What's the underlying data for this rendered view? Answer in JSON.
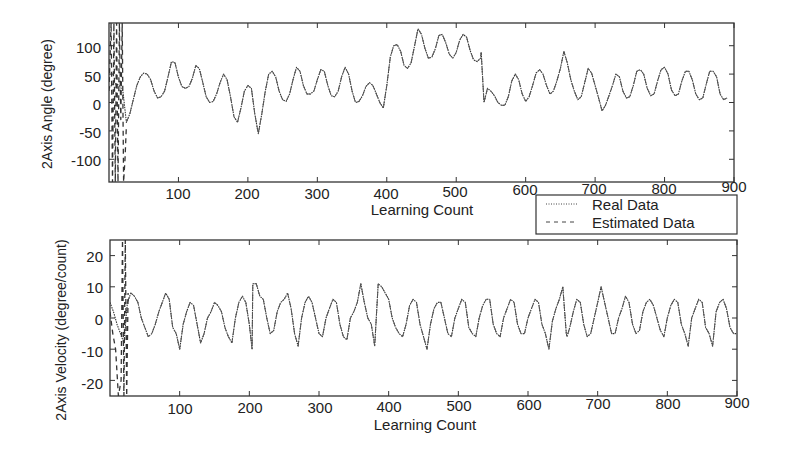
{
  "chart_data": [
    {
      "type": "line",
      "title": "",
      "xlabel": "Learning Count",
      "ylabel": "2Axis Angle (degree)",
      "xlim": [
        0,
        900
      ],
      "ylim": [
        -140,
        140
      ],
      "xticks": [
        100,
        200,
        300,
        400,
        500,
        600,
        700,
        800,
        900
      ],
      "xtick_labels": [
        "100",
        "200",
        "300",
        "400",
        "500",
        "600",
        "700",
        "800",
        "900"
      ],
      "yticks": [
        100,
        50,
        0,
        -50,
        -100
      ],
      "ytick_labels": [
        "100",
        "50",
        "0",
        "-50",
        "-100"
      ],
      "grid": false,
      "series": [
        {
          "name": "Real Data",
          "style": "dotted",
          "x": [
            0,
            5,
            10,
            15,
            20,
            25,
            30,
            35,
            40,
            45,
            50,
            55,
            60,
            65,
            70,
            75,
            80,
            85,
            90,
            95,
            100,
            105,
            110,
            115,
            120,
            125,
            130,
            135,
            140,
            145,
            150,
            155,
            160,
            165,
            170,
            175,
            180,
            185,
            190,
            195,
            200,
            205,
            210,
            215,
            220,
            225,
            230,
            235,
            240,
            245,
            250,
            255,
            260,
            265,
            270,
            275,
            280,
            285,
            290,
            295,
            300,
            305,
            310,
            315,
            320,
            325,
            330,
            335,
            340,
            345,
            350,
            355,
            360,
            365,
            370,
            375,
            380,
            385,
            390,
            395,
            400,
            405,
            410,
            415,
            420,
            425,
            430,
            435,
            440,
            445,
            450,
            455,
            460,
            465,
            470,
            475,
            480,
            485,
            490,
            495,
            500,
            505,
            510,
            515,
            520,
            525,
            530,
            535,
            536,
            540,
            545,
            550,
            555,
            560,
            565,
            570,
            575,
            580,
            585,
            590,
            595,
            600,
            605,
            610,
            615,
            620,
            625,
            630,
            635,
            640,
            645,
            650,
            655,
            660,
            665,
            670,
            675,
            680,
            685,
            690,
            695,
            700,
            705,
            710,
            715,
            720,
            725,
            730,
            735,
            740,
            745,
            750,
            755,
            760,
            765,
            770,
            775,
            780,
            785,
            790,
            795,
            800,
            805,
            810,
            815,
            820,
            825,
            830,
            835,
            840,
            845,
            850,
            855,
            860,
            865,
            870,
            875,
            880,
            885,
            890,
            895,
            900
          ],
          "values": [
            25,
            32,
            33,
            30,
            20,
            -35,
            -20,
            5,
            30,
            45,
            52,
            50,
            40,
            20,
            8,
            10,
            20,
            45,
            72,
            70,
            45,
            28,
            25,
            28,
            42,
            65,
            60,
            35,
            10,
            0,
            2,
            15,
            35,
            50,
            40,
            10,
            -25,
            -35,
            -10,
            20,
            30,
            25,
            -20,
            -55,
            -20,
            20,
            50,
            55,
            45,
            20,
            5,
            2,
            15,
            40,
            62,
            55,
            30,
            15,
            15,
            20,
            40,
            58,
            55,
            30,
            12,
            10,
            20,
            45,
            62,
            50,
            20,
            0,
            2,
            12,
            28,
            35,
            30,
            15,
            0,
            -10,
            30,
            80,
            100,
            102,
            90,
            65,
            60,
            70,
            100,
            130,
            120,
            95,
            78,
            80,
            95,
            118,
            120,
            105,
            85,
            78,
            88,
            110,
            120,
            115,
            92,
            75,
            72,
            78,
            88,
            0,
            25,
            20,
            12,
            0,
            -5,
            -5,
            10,
            38,
            50,
            40,
            15,
            2,
            10,
            30,
            52,
            58,
            50,
            30,
            15,
            20,
            38,
            60,
            90,
            70,
            40,
            20,
            5,
            10,
            35,
            60,
            52,
            30,
            8,
            -15,
            -5,
            12,
            30,
            50,
            45,
            20,
            8,
            10,
            30,
            55,
            58,
            50,
            25,
            12,
            15,
            38,
            58,
            62,
            50,
            22,
            12,
            15,
            38,
            55,
            55,
            40,
            15,
            5,
            8,
            32,
            55,
            55,
            45,
            15,
            5,
            8
          ],
          "color": "#333333"
        },
        {
          "name": "Estimated Data",
          "style": "dashed",
          "note": "tracks Real Data closely; large divergent spikes (beyond +/-140) in the first ~25 counts",
          "x": [
            0,
            3,
            5,
            7,
            9,
            11,
            13,
            15,
            17,
            19,
            21,
            23,
            25
          ],
          "values": [
            20,
            140,
            -140,
            140,
            -140,
            140,
            -140,
            140,
            -30,
            140,
            -140,
            -100,
            -40
          ],
          "color": "#333333"
        }
      ],
      "legend": {
        "position": "below-right of upper plot",
        "entries": [
          "Real Data",
          "Estimated Data"
        ]
      }
    },
    {
      "type": "line",
      "title": "",
      "xlabel": "Learning Count",
      "ylabel": "2Axis Velocity (degree/count)",
      "xlim": [
        0,
        900
      ],
      "ylim": [
        -25,
        25
      ],
      "xticks": [
        100,
        200,
        300,
        400,
        500,
        600,
        700,
        800,
        900
      ],
      "xtick_labels": [
        "100",
        "200",
        "300",
        "400",
        "500",
        "600",
        "700",
        "800",
        "900"
      ],
      "yticks": [
        20,
        10,
        0,
        -10,
        -20
      ],
      "ytick_labels": [
        "20",
        "10",
        "0",
        "-10",
        "-20"
      ],
      "grid": false,
      "series": [
        {
          "name": "Real Data",
          "style": "dotted",
          "x": [
            0,
            5,
            10,
            15,
            20,
            25,
            30,
            35,
            40,
            45,
            50,
            55,
            60,
            65,
            70,
            75,
            80,
            85,
            90,
            95,
            100,
            105,
            110,
            115,
            120,
            125,
            130,
            135,
            140,
            145,
            150,
            155,
            160,
            165,
            170,
            175,
            180,
            185,
            190,
            195,
            200,
            204,
            205,
            210,
            215,
            220,
            225,
            230,
            235,
            240,
            245,
            250,
            255,
            260,
            265,
            270,
            275,
            280,
            285,
            290,
            295,
            300,
            305,
            310,
            315,
            320,
            325,
            330,
            335,
            340,
            345,
            350,
            355,
            360,
            365,
            370,
            375,
            380,
            385,
            390,
            395,
            400,
            405,
            410,
            415,
            420,
            425,
            430,
            435,
            440,
            445,
            450,
            455,
            460,
            465,
            470,
            475,
            480,
            485,
            490,
            495,
            500,
            505,
            510,
            515,
            520,
            525,
            530,
            535,
            540,
            545,
            550,
            555,
            560,
            565,
            570,
            575,
            580,
            585,
            590,
            595,
            600,
            605,
            610,
            615,
            620,
            625,
            630,
            635,
            640,
            645,
            650,
            655,
            656,
            660,
            665,
            670,
            675,
            680,
            685,
            690,
            695,
            700,
            705,
            710,
            715,
            720,
            725,
            730,
            735,
            740,
            745,
            750,
            755,
            760,
            765,
            770,
            775,
            780,
            785,
            790,
            795,
            800,
            805,
            810,
            815,
            820,
            825,
            830,
            835,
            840,
            845,
            850,
            855,
            860,
            865,
            870,
            875,
            880,
            885,
            890,
            895,
            900
          ],
          "values": [
            5,
            2,
            -2,
            -5,
            -8,
            5,
            8,
            7,
            5,
            0,
            -3,
            -6,
            -5,
            -2,
            2,
            5,
            8,
            6,
            -3,
            -5,
            -10,
            -2,
            2,
            5,
            4,
            -2,
            -8,
            -5,
            0,
            2,
            5,
            4,
            2,
            -3,
            -6,
            -8,
            0,
            5,
            7,
            5,
            -2,
            -10,
            11,
            11,
            7,
            6,
            0,
            -5,
            -4,
            2,
            5,
            6,
            8,
            3,
            -5,
            -9,
            0,
            5,
            7,
            5,
            0,
            -5,
            -6,
            0,
            3,
            6,
            5,
            -2,
            -6,
            -7,
            0,
            2,
            5,
            11,
            5,
            0,
            -2,
            -9,
            11,
            10,
            8,
            6,
            0,
            -3,
            -5,
            -6,
            -2,
            4,
            6,
            5,
            -2,
            -6,
            -10,
            -2,
            3,
            5,
            5,
            0,
            -5,
            -6,
            0,
            3,
            6,
            5,
            -3,
            -5,
            -6,
            0,
            4,
            6,
            6,
            -2,
            -5,
            -6,
            0,
            3,
            6,
            5,
            -2,
            -5,
            -5,
            0,
            3,
            6,
            5,
            -2,
            -5,
            -10,
            -1,
            3,
            6,
            10,
            -5,
            -6,
            -3,
            2,
            6,
            5,
            -2,
            -6,
            -5,
            0,
            5,
            10,
            5,
            0,
            -5,
            -5,
            0,
            3,
            7,
            5,
            -2,
            -5,
            -4,
            2,
            5,
            6,
            4,
            0,
            -4,
            -6,
            0,
            4,
            6,
            5,
            -2,
            -5,
            -9,
            0,
            3,
            6,
            5,
            -3,
            -5,
            -9,
            2,
            5,
            6,
            3,
            -3,
            -5,
            -5,
            2,
            2
          ],
          "color": "#333333"
        },
        {
          "name": "Estimated Data",
          "style": "dashed",
          "note": "tracks Real Data closely; large divergent spikes (beyond +/-25) in the first ~25 counts",
          "x": [
            0,
            4,
            8,
            12,
            16,
            18,
            20,
            22,
            24,
            26
          ],
          "values": [
            2,
            -5,
            -10,
            -25,
            -20,
            25,
            -25,
            25,
            -25,
            8
          ],
          "color": "#333333"
        }
      ]
    }
  ],
  "plots": {
    "top": {
      "ylabel": "2Axis Angle (degree)",
      "xlabel": "Learning Count",
      "yticks": [
        "100",
        "50",
        "0",
        "-50",
        "-100"
      ],
      "xticks": [
        "100",
        "200",
        "300",
        "400",
        "500",
        "600",
        "700",
        "800",
        "900"
      ]
    },
    "bottom": {
      "ylabel": "2Axis Velocity (degree/count)",
      "xlabel": "Learning Count",
      "yticks": [
        "20",
        "10",
        "0",
        "-10",
        "-20"
      ],
      "xticks": [
        "100",
        "200",
        "300",
        "400",
        "500",
        "600",
        "700",
        "800",
        "900"
      ]
    }
  },
  "legend": {
    "real_label": "Real Data",
    "estimated_label": "Estimated Data"
  }
}
